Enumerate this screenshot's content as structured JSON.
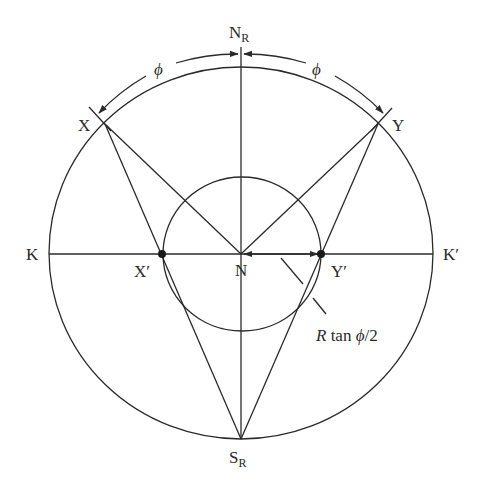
{
  "diagram": {
    "type": "geometric construction (stereographic / Wulff net construction)",
    "labels": {
      "north_pole": "N",
      "north_pole_sub": "R",
      "south_pole": "S",
      "south_pole_sub": "R",
      "left": "K",
      "right": "K′",
      "point_x": "X",
      "point_y": "Y",
      "proj_x": "X′",
      "proj_y": "Y′",
      "center": "N",
      "angle_left": "ϕ",
      "angle_right": "ϕ",
      "distance_R": "R",
      "distance_rest": " tan ",
      "distance_phi": "ϕ",
      "distance_tail": "/2"
    },
    "colors": {
      "stroke": "#2a2a2a",
      "background": "#ffffff"
    }
  }
}
